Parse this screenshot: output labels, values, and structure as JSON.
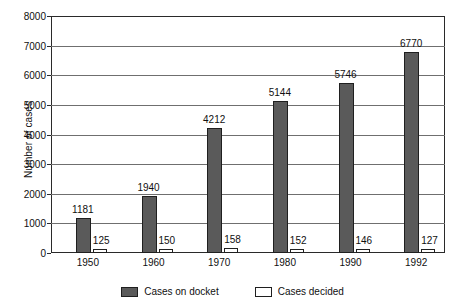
{
  "chart_data": {
    "type": "bar",
    "title": "",
    "subtitle": "",
    "xlabel": "",
    "ylabel": "Number of cases",
    "categories": [
      "1950",
      "1960",
      "1970",
      "1980",
      "1990",
      "1992"
    ],
    "series": [
      {
        "name": "Cases on docket",
        "color": "#5a5a5a",
        "values": [
          1181,
          1940,
          4212,
          5144,
          5746,
          6770
        ],
        "labels": [
          "1181",
          "1940",
          "4212",
          "5144",
          "5746",
          "6770"
        ]
      },
      {
        "name": "Cases decided",
        "color": "#ffffff",
        "values": [
          125,
          150,
          158,
          152,
          146,
          127
        ],
        "labels": [
          "125",
          "150",
          "158",
          "152",
          "146",
          "127"
        ]
      }
    ],
    "ylim": [
      0,
      8000
    ],
    "y_ticks": [
      0,
      1000,
      2000,
      3000,
      4000,
      5000,
      6000,
      7000,
      8000
    ],
    "y_tick_labels": [
      "0",
      "1000",
      "2000",
      "3000",
      "4000",
      "5000",
      "6000",
      "7000",
      "8000"
    ],
    "grid": true,
    "legend_position": "bottom",
    "legend": [
      "Cases on docket",
      "Cases decided"
    ]
  },
  "legend": {
    "items": [
      {
        "label": "Cases on docket",
        "swatch": "legend-swatch-filled"
      },
      {
        "label": "Cases decided",
        "swatch": "legend-swatch-outline"
      }
    ]
  }
}
